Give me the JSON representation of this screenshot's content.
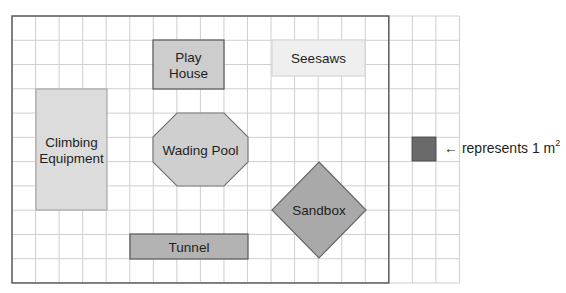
{
  "diagram": {
    "grid": {
      "origin_x": 12,
      "origin_y": 16,
      "cell_w": 23.55,
      "cell_h": 24.27,
      "main_cols": 16,
      "rows": 11,
      "extra_cols": 3,
      "line_color": "#cfcfcf",
      "border_color": "#555555"
    },
    "areas": [
      {
        "id": "play-house",
        "label_lines": [
          "Play",
          "House"
        ],
        "shape": "rect",
        "x": 153,
        "y": 40,
        "w": 71,
        "h": 49,
        "fill": "#cdcdcd",
        "stroke": "#555555"
      },
      {
        "id": "seesaws",
        "label_lines": [
          "Seesaws"
        ],
        "shape": "rect",
        "x": 272,
        "y": 40,
        "w": 93,
        "h": 36,
        "fill": "#efefef",
        "stroke": "#d6d6d6"
      },
      {
        "id": "climbing-equipment",
        "label_lines": [
          "Climbing",
          "Equipment"
        ],
        "shape": "rect",
        "x": 36,
        "y": 89,
        "w": 71,
        "h": 121,
        "fill": "#dcdcdc",
        "stroke": "#a8a8a8"
      },
      {
        "id": "wading-pool",
        "label_lines": [
          "Wading Pool"
        ],
        "shape": "octagon",
        "points": "177,113 224,113 248,137 248,162 224,186 177,186 153,162 153,137",
        "fill": "#cfcfcf",
        "stroke": "#777777"
      },
      {
        "id": "sandbox",
        "label_lines": [
          "Sandbox"
        ],
        "shape": "diamond",
        "points": "319,162 366,210 319,258 272,210",
        "fill": "#a9a9a9",
        "stroke": "#666666"
      },
      {
        "id": "tunnel",
        "label_lines": [
          "Tunnel"
        ],
        "shape": "rect",
        "x": 130,
        "y": 234,
        "w": 118,
        "h": 25,
        "fill": "#b3b3b3",
        "stroke": "#555555"
      }
    ],
    "legend": {
      "square": {
        "x": 412,
        "y": 137,
        "w": 24,
        "h": 24,
        "fill": "#6a6a6a"
      },
      "arrow": "←",
      "text": "represents 1 m",
      "superscript": "2"
    }
  }
}
